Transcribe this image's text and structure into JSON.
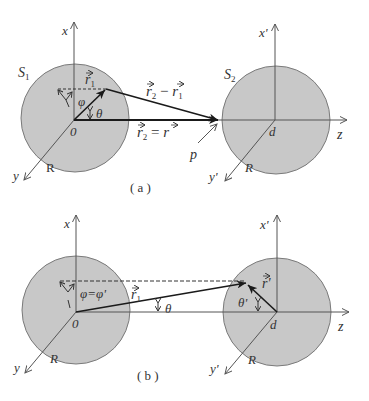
{
  "figure": {
    "panels": [
      {
        "id": "a",
        "caption": "( a )",
        "sphere1": {
          "label": "S",
          "label_sub": "1",
          "origin_label": "0",
          "radius_label": "R",
          "axis_x": "x",
          "axis_y": "y"
        },
        "sphere2": {
          "label": "S",
          "label_sub": "2",
          "center_label": "d",
          "radius_label": "R",
          "axis_x": "x'",
          "axis_y": "y'",
          "axis_z": "z"
        },
        "vectors": {
          "r1": "r",
          "r1_sub": "1",
          "diff_a": "r",
          "diff_a_sub": "2",
          "diff_op": " − ",
          "diff_b": "r",
          "diff_b_sub": "1",
          "r2": "r",
          "r2_sub": "2",
          "r2_eq": " = ",
          "r2_rhs": "r"
        },
        "angles": {
          "phi": "φ",
          "theta": "θ"
        },
        "point_label": "p"
      },
      {
        "id": "b",
        "caption": "( b )",
        "sphere1": {
          "origin_label": "0",
          "radius_label": "R",
          "axis_x": "x",
          "axis_y": "y"
        },
        "sphere2": {
          "center_label": "d",
          "radius_label": "R",
          "axis_x": "x'",
          "axis_y": "y'",
          "axis_z": "z"
        },
        "vectors": {
          "r1": "r",
          "r1_sub": "1",
          "rprime": "r'"
        },
        "angles": {
          "phi_eq": "φ=φ'",
          "theta": "θ",
          "theta_prime": "θ'"
        }
      }
    ],
    "colors": {
      "sphere_fill": "#c8c8c8",
      "sphere_stroke": "#7a7a7a",
      "axis": "#555555",
      "vector": "#1a1a1a"
    }
  }
}
